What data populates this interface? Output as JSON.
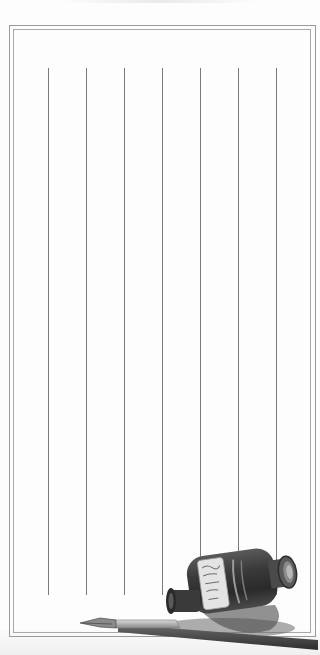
{
  "page": {
    "type": "stationery"
  },
  "frame": {
    "outer": {
      "x": 9,
      "y": 25,
      "w": 307,
      "h": 612
    },
    "inner": {
      "x": 13,
      "y": 29,
      "w": 298,
      "h": 604
    }
  },
  "rules": {
    "x_positions": [
      48,
      86,
      124,
      162,
      200,
      238,
      276
    ],
    "top": 68,
    "bottom": 595,
    "color": "#7a7a7a"
  },
  "illustration": {
    "items": [
      "inkwell-icon",
      "dip-pen-icon"
    ],
    "colors": {
      "ink_dark": "#2e2e2e",
      "glass_mid": "#6a6a6a",
      "label": "#e6e6e6",
      "shadow": "#555555"
    }
  }
}
